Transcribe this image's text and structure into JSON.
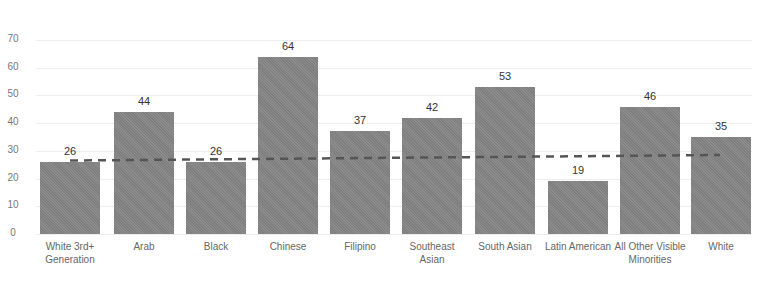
{
  "chart_data": {
    "type": "bar",
    "title": "",
    "xlabel": "",
    "ylabel": "",
    "ylim": [
      0,
      70
    ],
    "yticks": [
      0,
      10,
      20,
      30,
      40,
      50,
      60,
      70
    ],
    "grid": true,
    "categories": [
      "White 3rd+ Generation",
      "Arab",
      "Black",
      "Chinese",
      "Filipino",
      "Southeast Asian",
      "South Asian",
      "Latin American",
      "All Other Visible Minorities",
      "White"
    ],
    "values": [
      26,
      44,
      26,
      64,
      37,
      42,
      53,
      19,
      46,
      35
    ],
    "reference_line": {
      "style": "dashed",
      "start_value": 26.5,
      "end_value": 28.5
    },
    "bar_color": "#8c8c8c",
    "line_color": "#555555"
  }
}
